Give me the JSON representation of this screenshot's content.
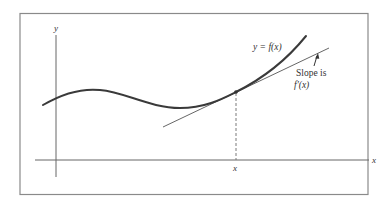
{
  "figure": {
    "axes": {
      "x_label": "x",
      "y_label": "y"
    },
    "curve_label": "y = f(x)",
    "point_label": "x",
    "annotation": {
      "line1": "Slope is",
      "line2": "f′(x)"
    },
    "colors": {
      "frame": "#8a8a8a",
      "axes": "#555555",
      "curve": "#3a3a3a",
      "tangent": "#555555",
      "dashed": "#7a7a7a"
    }
  }
}
